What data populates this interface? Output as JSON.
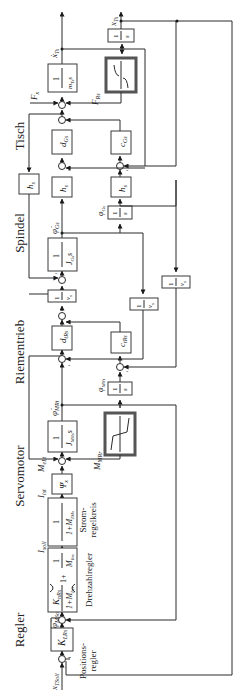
{
  "diagram": {
    "orientation": "rotated-90-ccw",
    "colors": {
      "line": "#2a2a2a",
      "box_border": "#3a3a3a",
      "nonlinear_border": "#555555",
      "background": "#ffffff"
    },
    "section_labels": [
      "Regler",
      "Servomotor",
      "Riementrieb",
      "Spindel",
      "Tisch"
    ],
    "sections": {
      "regler": "Regler",
      "servomotor": "Servomotor",
      "riementrieb": "Riementrieb",
      "spindel": "Spindel",
      "tisch": "Tisch"
    },
    "annotations": {
      "positionsregler_1": "Positions-",
      "positionsregler_2": "regler",
      "drehzahlregler": "Drehzahlregler",
      "stromregelkreis_1": "Strom-",
      "stromregelkreis_2": "regelkreis"
    },
    "signals": {
      "x_tsoll": "x",
      "x_tsoll_sub": "TSoll",
      "phi_msoll": "φ̇",
      "phi_msoll_sub": "MSoll",
      "i_soll": "I",
      "i_soll_sub": "soll",
      "i_ist": "I",
      "i_ist_sub": "ist",
      "m_ist": "M",
      "m_ist_sub": "eLt",
      "m_mr": "M",
      "m_mr_sub": "MRr",
      "phi_dot_mr": "φ̇",
      "phi_dot_mr_sub": "MRt",
      "phi_mr": "φ",
      "phi_mr_sub": "MRt",
      "phi_dot_g": "φ̇",
      "phi_dot_g_sub": "Gs",
      "phi_g": "φ",
      "phi_g_sub": "Gs",
      "f_x": "F",
      "f_x_sub": "x",
      "f_r": "F",
      "f_r_sub": "Rs",
      "x_dot_t": "ẋ",
      "x_dot_t_sub": "Ts",
      "x_t": "x",
      "x_t_sub": "Ts"
    },
    "blocks": {
      "k_lr": {
        "main": "K",
        "sub": "LRs"
      },
      "pi_num": {
        "main": "K",
        "sub": "nRs"
      },
      "pi_den": "1+M",
      "pi_den_sub": "Inx",
      "pi_plus": "1+",
      "pi_frac_num": "1",
      "pi_frac_den": "M",
      "pi_frac_den_sub": "Inx",
      "strom_num": "1",
      "strom_den": "1+M",
      "strom_den_sub": "IMx",
      "psi": {
        "main": "Ψ",
        "sub": "x"
      },
      "j_mr_num": "1",
      "j_mr_den": "J",
      "j_mr_den_sub": "MRs",
      "int_num": "1",
      "int_den": "s",
      "d_r": {
        "main": "d",
        "sub": "tRs"
      },
      "c_r": {
        "main": "c",
        "sub": "tRs"
      },
      "nu_num": "1",
      "nu_den": "ν",
      "nu_den_sub": "s",
      "j_g_num": "1",
      "j_g_den": "J",
      "j_g_den_sub": "Gs",
      "h_s": {
        "main": "h",
        "sub": "s"
      },
      "d_g": {
        "main": "d",
        "sub": "Gs"
      },
      "c_g": {
        "main": "c",
        "sub": "Gs"
      },
      "m_t_num": "1",
      "m_t_den": "m",
      "m_t_den_sub": "Ts",
      "s_suffix": "s"
    },
    "sign_minus": "-"
  }
}
